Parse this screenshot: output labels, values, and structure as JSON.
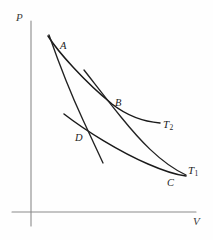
{
  "figure": {
    "kind": "hand-drawn-carnot-cycle-pv-diagram",
    "background_color": "#fefefe",
    "ink_color": "#1a1a1a",
    "axis_color": "#8a8a8a"
  },
  "axes": {
    "y_label": "P",
    "x_label": "V",
    "y_label_pos": [
      16,
      12
    ],
    "x_label_pos": [
      193,
      216
    ],
    "origin": [
      31,
      212
    ],
    "y_axis_top": 21,
    "x_axis_right": 196
  },
  "point_labels": [
    {
      "name": "A",
      "text": "A",
      "x": 60,
      "y": 41
    },
    {
      "name": "B",
      "text": "B",
      "x": 115,
      "y": 98
    },
    {
      "name": "C",
      "text": "C",
      "x": 167,
      "y": 178
    },
    {
      "name": "D",
      "text": "D",
      "x": 75,
      "y": 133
    }
  ],
  "curve_labels": [
    {
      "name": "T2",
      "base": "T",
      "sub": "2",
      "x": 163,
      "y": 119
    },
    {
      "name": "T1",
      "base": "T",
      "sub": "1",
      "x": 188,
      "y": 165
    }
  ],
  "chart_data": {
    "type": "line",
    "title": "",
    "xlabel": "V",
    "ylabel": "P",
    "grid": false,
    "legend": "inline-curve-labels",
    "annotations": [
      "A",
      "B",
      "C",
      "D",
      "T1",
      "T2"
    ],
    "cycle_points": {
      "A": [
        56,
        49
      ],
      "B": [
        121,
        116
      ],
      "C": [
        172,
        176
      ],
      "D": [
        87,
        133
      ]
    },
    "series": [
      {
        "name": "isotherm-T2",
        "label": "T2",
        "path": "M 48,36 C 58,52 85,82 112,104 C 130,118 148,122 160,123"
      },
      {
        "name": "isotherm-T1",
        "label": "T1",
        "path": "M 64,114 C 86,131 120,152 148,164 C 164,171 177,175 186,176"
      },
      {
        "name": "adiabat-A-to-D",
        "label": "",
        "path": "M 49,35 C 56,55 70,92 83,120 C 89,133 96,148 103,163"
      },
      {
        "name": "adiabat-B-to-C",
        "label": "",
        "path": "M 84,70 C 95,84 108,101 121,117 C 138,138 160,163 186,175"
      }
    ]
  }
}
